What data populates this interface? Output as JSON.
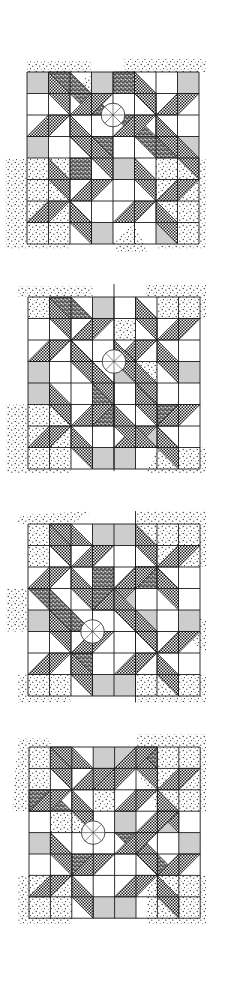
{
  "figure": {
    "panel_count": 4,
    "grid": {
      "cols": 8,
      "rows": 8
    },
    "colors": {
      "background": "#ffffff",
      "line": "#1a1a1a",
      "gray_square": "#cdcdcd",
      "hatch_dark": "#1c1c1c",
      "stipple_dot": "#2a2a2a",
      "dark_stipple": "#3a3a3a"
    }
  },
  "panels": [
    {
      "id": "panel-1",
      "origin": [
        27,
        72
      ],
      "cell": 21.5,
      "circle": {
        "at": [
          4,
          2
        ],
        "r": 0.55
      },
      "gray": [
        [
          0,
          0
        ],
        [
          3,
          0
        ],
        [
          7,
          0
        ],
        [
          0,
          3
        ],
        [
          4,
          4
        ],
        [
          7,
          3
        ],
        [
          3,
          7
        ],
        [
          6,
          7
        ]
      ],
      "stipple": [
        [
          [
            0,
            -0.5
          ],
          [
            3,
            -0.5
          ],
          [
            3,
            0
          ],
          [
            0,
            0
          ]
        ],
        [
          [
            4.5,
            -0.6
          ],
          [
            8.3,
            -0.6
          ],
          [
            8.3,
            0
          ],
          [
            4.5,
            0
          ]
        ],
        [
          [
            -1,
            4
          ],
          [
            2,
            4
          ],
          [
            2,
            8.2
          ],
          [
            -1,
            8.2
          ]
        ],
        [
          [
            6,
            4
          ],
          [
            8.3,
            4
          ],
          [
            8.3,
            8.2
          ],
          [
            6,
            8.2
          ]
        ],
        [
          [
            2,
            1
          ],
          [
            3,
            0
          ],
          [
            3,
            1
          ]
        ],
        [
          [
            5,
            2
          ],
          [
            6,
            3
          ],
          [
            5,
            3
          ]
        ],
        [
          [
            4,
            8
          ],
          [
            5,
            7
          ],
          [
            5.6,
            8.4
          ],
          [
            4.2,
            8.4
          ]
        ]
      ],
      "dark_stipple": [
        [
          [
            1,
            0
          ],
          [
            2,
            0
          ],
          [
            4,
            2
          ],
          [
            3,
            2
          ]
        ],
        [
          [
            4,
            0
          ],
          [
            5,
            0
          ],
          [
            5,
            1
          ],
          [
            4,
            1
          ]
        ],
        [
          [
            3,
            3
          ],
          [
            4,
            3
          ],
          [
            4,
            4
          ],
          [
            3,
            4
          ]
        ],
        [
          [
            4,
            2
          ],
          [
            5,
            2
          ],
          [
            7,
            4
          ],
          [
            6,
            4
          ]
        ],
        [
          [
            2,
            4
          ],
          [
            3,
            4
          ],
          [
            3,
            5
          ],
          [
            2,
            5
          ]
        ]
      ],
      "hatch": [
        {
          "pinwheel": [
            2,
            2
          ]
        },
        {
          "pinwheel": [
            6,
            2
          ]
        },
        {
          "pinwheel": [
            2,
            6
          ]
        },
        {
          "pinwheel": [
            6,
            6
          ]
        },
        [
          [
            5,
            0
          ],
          [
            6,
            1
          ],
          [
            6,
            2
          ],
          [
            5,
            1
          ]
        ],
        [
          [
            2,
            2
          ],
          [
            4,
            4
          ],
          [
            4,
            5
          ],
          [
            2,
            3
          ]
        ],
        [
          [
            6,
            2
          ],
          [
            8,
            4
          ],
          [
            8,
            5
          ],
          [
            6,
            3
          ]
        ]
      ]
    },
    {
      "id": "panel-2",
      "origin": [
        28,
        297
      ],
      "cell": 21.5,
      "circle": {
        "at": [
          4,
          3
        ],
        "r": 0.55
      },
      "center_line": {
        "x": 4,
        "from": -0.6,
        "to": 8.1
      },
      "gray": [
        [
          3,
          0
        ],
        [
          4,
          3
        ],
        [
          0,
          3
        ],
        [
          0,
          4
        ],
        [
          7,
          3
        ],
        [
          3,
          7
        ],
        [
          4,
          7
        ],
        [
          5,
          6
        ]
      ],
      "stipple": [
        [
          [
            -0.5,
            -0.5
          ],
          [
            3,
            -0.5
          ],
          [
            3,
            0
          ],
          [
            -0.5,
            0
          ]
        ],
        [
          [
            0,
            0
          ],
          [
            1,
            0
          ],
          [
            1,
            1
          ],
          [
            0,
            1
          ]
        ],
        [
          [
            5.5,
            -0.6
          ],
          [
            8.3,
            -0.6
          ],
          [
            8.3,
            1
          ],
          [
            6,
            1
          ],
          [
            6,
            0
          ],
          [
            5.5,
            0
          ]
        ],
        [
          [
            -1,
            5
          ],
          [
            2,
            5
          ],
          [
            2,
            8.2
          ],
          [
            -1,
            8.2
          ]
        ],
        [
          [
            6,
            7
          ],
          [
            8.3,
            7
          ],
          [
            8.3,
            8.2
          ],
          [
            5.5,
            8.2
          ]
        ],
        [
          [
            4,
            1
          ],
          [
            5,
            1
          ],
          [
            5,
            2
          ],
          [
            4,
            2
          ]
        ],
        [
          [
            5,
            3
          ],
          [
            6,
            3
          ],
          [
            6,
            5
          ],
          [
            5,
            5
          ]
        ]
      ],
      "dark_stipple": [
        [
          [
            1,
            0
          ],
          [
            2,
            0
          ],
          [
            3,
            1
          ],
          [
            2,
            1
          ]
        ],
        [
          [
            3,
            4
          ],
          [
            4,
            4
          ],
          [
            4,
            6
          ],
          [
            3,
            6
          ]
        ],
        [
          [
            5,
            0
          ],
          [
            6,
            1
          ],
          [
            6,
            2
          ],
          [
            5,
            1
          ]
        ],
        [
          [
            6,
            5
          ],
          [
            7,
            5
          ],
          [
            7,
            6
          ],
          [
            6,
            6
          ]
        ]
      ],
      "hatch": [
        {
          "pinwheel": [
            2,
            2
          ]
        },
        {
          "pinwheel": [
            6,
            2
          ]
        },
        {
          "pinwheel": [
            2,
            6
          ]
        },
        {
          "pinwheel": [
            6,
            6
          ]
        },
        [
          [
            2,
            2
          ],
          [
            4,
            4
          ],
          [
            4,
            5
          ],
          [
            2,
            3
          ]
        ],
        [
          [
            4,
            2
          ],
          [
            6,
            4
          ],
          [
            6,
            5
          ],
          [
            4,
            3
          ]
        ],
        [
          [
            4,
            5
          ],
          [
            6,
            7
          ],
          [
            5,
            7
          ],
          [
            4,
            6
          ]
        ]
      ]
    },
    {
      "id": "panel-3",
      "origin": [
        28,
        524
      ],
      "cell": 21.5,
      "circle": {
        "at": [
          3,
          5
        ],
        "r": 0.55
      },
      "center_line": {
        "x": 5,
        "from": -0.6,
        "to": 8.3
      },
      "gray": [
        [
          3,
          0
        ],
        [
          4,
          0
        ],
        [
          0,
          4
        ],
        [
          4,
          3
        ],
        [
          5,
          4
        ],
        [
          7,
          4
        ],
        [
          3,
          7
        ],
        [
          4,
          7
        ]
      ],
      "stipple": [
        [
          [
            -0.5,
            -0.4
          ],
          [
            3,
            -0.6
          ],
          [
            2,
            0
          ],
          [
            -0.5,
            0
          ]
        ],
        [
          [
            0,
            0
          ],
          [
            1,
            0
          ],
          [
            1,
            2
          ],
          [
            0,
            2
          ]
        ],
        [
          [
            5,
            -0.6
          ],
          [
            8.3,
            -0.6
          ],
          [
            8.3,
            2
          ],
          [
            6,
            2
          ],
          [
            5,
            1
          ]
        ],
        [
          [
            -1,
            3
          ],
          [
            0,
            3
          ],
          [
            0,
            5
          ],
          [
            -1,
            5
          ]
        ],
        [
          [
            -0.5,
            7
          ],
          [
            2,
            7
          ],
          [
            2,
            8.3
          ],
          [
            -0.5,
            8.3
          ]
        ],
        [
          [
            5,
            7
          ],
          [
            8.3,
            7
          ],
          [
            8.3,
            8.3
          ],
          [
            5,
            8.3
          ]
        ],
        [
          [
            7,
            4
          ],
          [
            8.3,
            4.5
          ],
          [
            8.3,
            6
          ],
          [
            7,
            5
          ]
        ]
      ],
      "dark_stipple": [
        [
          [
            0,
            3
          ],
          [
            1,
            3
          ],
          [
            3,
            5
          ],
          [
            2,
            5
          ]
        ],
        [
          [
            3,
            2
          ],
          [
            4,
            2
          ],
          [
            4,
            4
          ],
          [
            3,
            4
          ]
        ],
        [
          [
            5,
            2
          ],
          [
            6,
            2
          ],
          [
            6,
            3
          ],
          [
            5,
            3
          ]
        ],
        [
          [
            2,
            6
          ],
          [
            3,
            6
          ],
          [
            3,
            7
          ],
          [
            2,
            7
          ]
        ]
      ],
      "hatch": [
        {
          "pinwheel": [
            2,
            2
          ]
        },
        {
          "pinwheel": [
            6,
            2
          ]
        },
        {
          "pinwheel": [
            2,
            6
          ]
        },
        {
          "pinwheel": [
            6,
            6
          ]
        },
        [
          [
            1,
            0
          ],
          [
            2,
            0
          ],
          [
            3,
            1
          ],
          [
            2,
            1
          ]
        ],
        [
          [
            3,
            4
          ],
          [
            5,
            2
          ],
          [
            6,
            2
          ],
          [
            4,
            4
          ]
        ],
        [
          [
            4,
            3
          ],
          [
            6,
            5
          ],
          [
            6,
            6
          ],
          [
            4,
            4
          ]
        ]
      ]
    },
    {
      "id": "panel-4",
      "origin": [
        29,
        747
      ],
      "cell": 21.4,
      "circle": {
        "at": [
          3,
          4
        ],
        "r": 0.55
      },
      "gray": [
        [
          3,
          0
        ],
        [
          4,
          0
        ],
        [
          0,
          4
        ],
        [
          4,
          3
        ],
        [
          7,
          4
        ],
        [
          3,
          7
        ],
        [
          4,
          7
        ],
        [
          6,
          3
        ]
      ],
      "stipple": [
        [
          [
            -0.5,
            -0.4
          ],
          [
            1,
            -0.4
          ],
          [
            1,
            3
          ],
          [
            -0.8,
            3
          ]
        ],
        [
          [
            5,
            -0.6
          ],
          [
            8.3,
            -0.6
          ],
          [
            8.3,
            3
          ],
          [
            6,
            3
          ],
          [
            5,
            1
          ]
        ],
        [
          [
            -0.5,
            6
          ],
          [
            2,
            6
          ],
          [
            2,
            8.3
          ],
          [
            -0.5,
            8.3
          ]
        ],
        [
          [
            5.5,
            6
          ],
          [
            8.3,
            6
          ],
          [
            8.3,
            8.3
          ],
          [
            5.5,
            8.3
          ]
        ],
        [
          [
            3,
            1
          ],
          [
            4,
            1
          ],
          [
            4,
            3
          ],
          [
            3,
            3
          ]
        ],
        [
          [
            1,
            3
          ],
          [
            3,
            3
          ],
          [
            3,
            4
          ],
          [
            1,
            4
          ]
        ]
      ],
      "dark_stipple": [
        [
          [
            0,
            2
          ],
          [
            1,
            2
          ],
          [
            2,
            3
          ],
          [
            0,
            3
          ]
        ],
        [
          [
            4,
            4
          ],
          [
            5,
            4
          ],
          [
            7,
            6
          ],
          [
            6,
            6
          ]
        ],
        [
          [
            5,
            0
          ],
          [
            6,
            0
          ],
          [
            6,
            1
          ],
          [
            5,
            1
          ]
        ],
        [
          [
            2,
            5
          ],
          [
            3,
            5
          ],
          [
            3,
            6
          ],
          [
            2,
            6
          ]
        ]
      ],
      "hatch": [
        {
          "pinwheel": [
            2,
            2
          ]
        },
        {
          "pinwheel": [
            6,
            2
          ]
        },
        {
          "pinwheel": [
            2,
            6
          ]
        },
        {
          "pinwheel": [
            6,
            6
          ]
        },
        [
          [
            1,
            0
          ],
          [
            2,
            0
          ],
          [
            3,
            1
          ],
          [
            2,
            1
          ]
        ],
        [
          [
            3,
            2
          ],
          [
            5,
            0
          ],
          [
            6,
            0
          ],
          [
            4,
            2
          ]
        ],
        [
          [
            4,
            5
          ],
          [
            6,
            3
          ],
          [
            7,
            3
          ],
          [
            5,
            5
          ]
        ]
      ]
    }
  ]
}
